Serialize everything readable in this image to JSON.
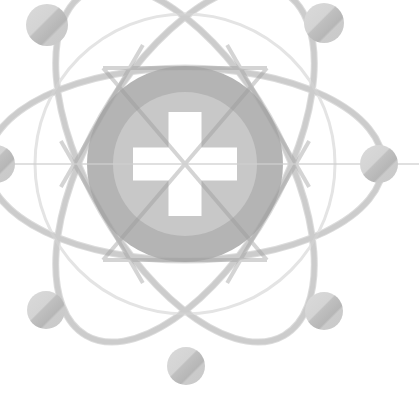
{
  "canvas": {
    "width": 419,
    "height": 402,
    "background": "#ffffff",
    "title": "Medical Atom Logo"
  },
  "palette": {
    "background": "#ffffff",
    "nucleus_outer": "#b4b4b4",
    "nucleus_inner": "#c8c8c8",
    "cross": "#ffffff",
    "orbit_stroke": "#dcdcdc",
    "chord_stroke": "#b0b0b0",
    "electron_light": "#d2d2d2",
    "electron_dark": "#b9b9b9",
    "electron_edge": "#c4c4c4"
  },
  "logo": {
    "name": "atom-medical-cross-logo",
    "center": {
      "x": 185,
      "y": 164
    },
    "nucleus": {
      "outer_radius": 98,
      "inner_radius": 72,
      "outer_color": "#b4b4b4",
      "inner_color": "#c8c8c8"
    },
    "cross": {
      "label": "medical-cross",
      "arm_length": 104,
      "arm_thickness": 33,
      "color": "#ffffff"
    },
    "orbits": [
      {
        "id": "orbit-1",
        "rotation": 0,
        "rx": 198,
        "ry": 96,
        "stroke": "#dcdcdc",
        "width": 7
      },
      {
        "id": "orbit-2",
        "rotation": 60,
        "rx": 198,
        "ry": 96,
        "stroke": "#dcdcdc",
        "width": 7
      },
      {
        "id": "orbit-3",
        "rotation": 120,
        "rx": 198,
        "ry": 96,
        "stroke": "#dcdcdc",
        "width": 7
      }
    ],
    "chords": [
      {
        "id": "chord-1",
        "rotation": 0,
        "stroke": "#b0b0b0",
        "width": 4
      },
      {
        "id": "chord-2",
        "rotation": 60,
        "stroke": "#b0b0b0",
        "width": 4
      },
      {
        "id": "chord-3",
        "rotation": 120,
        "stroke": "#b0b0b0",
        "width": 4
      }
    ],
    "electrons": [
      {
        "id": "electron-top-left",
        "cx": 47,
        "cy": 25,
        "r": 21
      },
      {
        "id": "electron-top-right",
        "cx": 324,
        "cy": 23,
        "r": 20
      },
      {
        "id": "electron-right",
        "cx": 379,
        "cy": 164,
        "r": 19
      },
      {
        "id": "electron-left",
        "cx": -4,
        "cy": 164,
        "r": 19
      },
      {
        "id": "electron-bottom-left",
        "cx": 46,
        "cy": 310,
        "r": 19
      },
      {
        "id": "electron-bottom-right",
        "cx": 324,
        "cy": 311,
        "r": 19
      },
      {
        "id": "electron-bottom-center",
        "cx": 186,
        "cy": 366,
        "r": 19
      }
    ]
  }
}
